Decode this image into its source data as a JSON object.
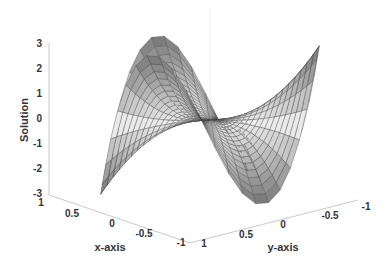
{
  "chart_data": {
    "type": "surface3d",
    "title": "",
    "xlabel": "x-axis",
    "ylabel": "y-axis",
    "zlabel": "Solution",
    "xlim": [
      -1,
      1
    ],
    "ylim": [
      -1,
      1
    ],
    "zlim": [
      -3,
      3
    ],
    "x_ticks": [
      "1",
      "0.5",
      "0",
      "-0.5",
      "-1"
    ],
    "y_ticks": [
      "1",
      "0.5",
      "0",
      "-0.5",
      "-1"
    ],
    "z_ticks": [
      "3",
      "2",
      "1",
      "0",
      "-1",
      "-2",
      "-3"
    ],
    "domain": "unit disk (polar mesh)",
    "function_approx": "z = 3 * r^3 * cos(3*theta)",
    "colormap": "grayscale",
    "grid": false
  }
}
